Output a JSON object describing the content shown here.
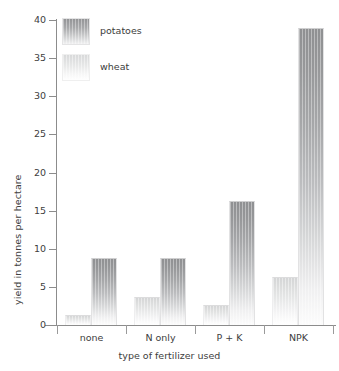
{
  "chart_data": {
    "type": "bar",
    "title": "",
    "xlabel": "type of fertilizer used",
    "ylabel": "yield in tonnes per hectare",
    "categories": [
      "none",
      "N only",
      "P + K",
      "NPK"
    ],
    "series": [
      {
        "name": "wheat",
        "values": [
          1.3,
          3.7,
          2.6,
          6.3
        ],
        "color": "#dcdddd"
      },
      {
        "name": "potatoes",
        "values": [
          8.8,
          8.8,
          16.3,
          39.0
        ],
        "color": "#97989a"
      }
    ],
    "ylim": [
      0,
      40
    ],
    "yticks": [
      0,
      5,
      10,
      15,
      20,
      25,
      30,
      35,
      40
    ],
    "ytick_labels": [
      "0",
      "5",
      "10",
      "15",
      "20",
      "25",
      "30",
      "35",
      "40"
    ],
    "grid": false,
    "legend_position": "top-left",
    "legend_entries": [
      "potatoes",
      "wheat"
    ],
    "series_order_in_group": [
      "wheat",
      "potatoes"
    ]
  },
  "axes": {
    "y_title": "yield in tonnes per hectare",
    "x_title": "type of fertilizer used"
  },
  "legend": {
    "items": [
      {
        "label": "potatoes",
        "swatch": "potatoes-swatch"
      },
      {
        "label": "wheat",
        "swatch": "wheat-swatch"
      }
    ]
  }
}
